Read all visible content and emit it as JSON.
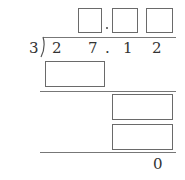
{
  "problem": {
    "divisor": "3",
    "dividend": [
      "2",
      "7",
      ".",
      "1",
      "2"
    ],
    "final_remainder": "0"
  },
  "quotient_boxes": [
    {
      "id": "q1",
      "value": ""
    },
    {
      "id": "q2",
      "value": ""
    },
    {
      "id": "q3",
      "value": ""
    }
  ],
  "quotient_decimal_point": ".",
  "work_boxes": [
    {
      "id": "w1",
      "value": ""
    },
    {
      "id": "w2",
      "value": ""
    },
    {
      "id": "w3",
      "value": ""
    }
  ]
}
